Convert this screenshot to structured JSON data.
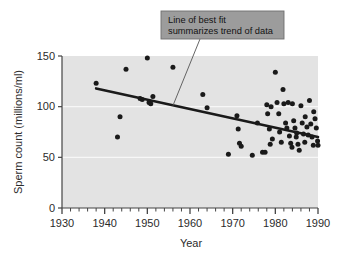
{
  "figure": {
    "name": "sperm-count-scatter-figure",
    "background_color": "#ffffff",
    "plot_background_color": "#e3e3e3",
    "gridline_color": "#f7f7f7",
    "point_color": "#1a1a1a",
    "trendline_color": "#1a1a1a",
    "axis_color": "#444444",
    "callout_fill": "#9c9c9c",
    "callout_border": "#6f6f6f",
    "callout_text_color": "#131313"
  },
  "annotation": {
    "line1": "Line of best fit",
    "line2": "summarizes trend of data"
  },
  "chart_data": {
    "type": "scatter",
    "title": "",
    "subtitle": "",
    "xlabel": "Year",
    "ylabel": "Sperm count (millions/ml)",
    "xlim": [
      1930,
      1990
    ],
    "ylim": [
      0,
      150
    ],
    "xticks": [
      1930,
      1940,
      1950,
      1960,
      1970,
      1980,
      1990
    ],
    "xtick_labels": [
      "1930",
      "1940",
      "1950",
      "1960",
      "1970",
      "1980",
      "1990"
    ],
    "minor_xtick_step": 2,
    "yticks": [
      0,
      50,
      100,
      150
    ],
    "ytick_labels": [
      "0",
      "50",
      "100",
      "150"
    ],
    "grid": "horizontal-minor-white",
    "legend": "none",
    "annotations": [
      {
        "text": "Line of best fit summarizes trend of data",
        "points_to_x": 1956,
        "points_to_y": 101
      }
    ],
    "series": [
      {
        "name": "Sperm count observations",
        "marker": "circle",
        "color": "#1a1a1a",
        "points": [
          [
            1938,
            123
          ],
          [
            1943,
            70
          ],
          [
            1943.6,
            90
          ],
          [
            1945,
            137
          ],
          [
            1948.3,
            108
          ],
          [
            1948.8,
            107
          ],
          [
            1950,
            148
          ],
          [
            1950.4,
            104
          ],
          [
            1950.8,
            103
          ],
          [
            1951.3,
            110
          ],
          [
            1956,
            139
          ],
          [
            1963,
            112
          ],
          [
            1964,
            99
          ],
          [
            1969,
            53
          ],
          [
            1971,
            91
          ],
          [
            1971.3,
            78
          ],
          [
            1971.6,
            64
          ],
          [
            1972,
            61
          ],
          [
            1974.6,
            52
          ],
          [
            1975.8,
            84
          ],
          [
            1977,
            55
          ],
          [
            1977.6,
            55
          ],
          [
            1978,
            102
          ],
          [
            1978.2,
            93
          ],
          [
            1978.6,
            78
          ],
          [
            1978.8,
            63
          ],
          [
            1979,
            100
          ],
          [
            1979.3,
            68
          ],
          [
            1980,
            134
          ],
          [
            1980.4,
            104
          ],
          [
            1980.8,
            93
          ],
          [
            1981,
            75
          ],
          [
            1981.4,
            65
          ],
          [
            1981.8,
            117
          ],
          [
            1982,
            103
          ],
          [
            1982.4,
            84
          ],
          [
            1982.7,
            79
          ],
          [
            1983,
            104
          ],
          [
            1983.3,
            71
          ],
          [
            1983.6,
            64
          ],
          [
            1983.9,
            60
          ],
          [
            1984,
            103
          ],
          [
            1984.3,
            86
          ],
          [
            1984.6,
            79
          ],
          [
            1984.9,
            70
          ],
          [
            1985,
            74
          ],
          [
            1985.3,
            63
          ],
          [
            1985.6,
            57
          ],
          [
            1986,
            101
          ],
          [
            1986.3,
            84
          ],
          [
            1986.6,
            73
          ],
          [
            1986.9,
            65
          ],
          [
            1987,
            90
          ],
          [
            1987.4,
            80
          ],
          [
            1987.7,
            72
          ],
          [
            1988,
            106
          ],
          [
            1988.3,
            83
          ],
          [
            1988.6,
            70
          ],
          [
            1988.9,
            62
          ],
          [
            1989,
            95
          ],
          [
            1989.3,
            88
          ],
          [
            1989.6,
            79
          ],
          [
            1989.9,
            66
          ],
          [
            1990,
            62
          ]
        ]
      }
    ],
    "trendline": {
      "name": "Line of best fit",
      "x_start": 1938,
      "y_start": 118,
      "x_end": 1990,
      "y_end": 70,
      "color": "#1a1a1a",
      "width": 2.6
    }
  }
}
